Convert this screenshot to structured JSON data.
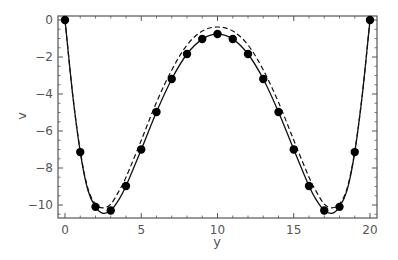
{
  "chart_data": {
    "type": "line",
    "title": "",
    "xlabel": "y",
    "ylabel": "v",
    "xlim": [
      -0.5,
      20.5
    ],
    "ylim": [
      -10.75,
      0.25
    ],
    "x_ticks": [
      0,
      5,
      10,
      15,
      20
    ],
    "y_ticks": [
      0,
      -2,
      -4,
      -6,
      -8,
      -10
    ],
    "grid": false,
    "legend": null,
    "series": [
      {
        "name": "data points",
        "style": "markers",
        "x": [
          0,
          1,
          2,
          3,
          4,
          5,
          6,
          7,
          8,
          9,
          10,
          11,
          12,
          13,
          14,
          15,
          16,
          17,
          18,
          19,
          20
        ],
        "values": [
          0,
          -7.14,
          -10.1,
          -10.3,
          -8.97,
          -7.0,
          -4.97,
          -3.19,
          -1.84,
          -1.03,
          -0.76,
          -1.03,
          -1.84,
          -3.19,
          -4.97,
          -7.0,
          -8.97,
          -10.3,
          -10.1,
          -7.14,
          0
        ]
      },
      {
        "name": "solid curve",
        "style": "solid",
        "x": [
          0,
          0.5,
          1,
          1.5,
          2,
          2.5,
          3,
          3.5,
          4,
          5,
          6,
          7,
          8,
          9,
          10,
          11,
          12,
          13,
          14,
          15,
          16,
          16.5,
          17,
          17.5,
          18,
          18.5,
          19,
          19.5,
          20
        ],
        "values": [
          0,
          -4.0,
          -7.14,
          -9.2,
          -10.1,
          -10.45,
          -10.3,
          -9.75,
          -8.97,
          -7.0,
          -4.97,
          -3.19,
          -1.84,
          -1.03,
          -0.76,
          -1.03,
          -1.84,
          -3.19,
          -4.97,
          -7.0,
          -8.97,
          -9.75,
          -10.3,
          -10.45,
          -10.1,
          -9.2,
          -7.14,
          -4.0,
          0
        ]
      },
      {
        "name": "dashed curve",
        "style": "dashed",
        "x": [
          0,
          0.5,
          1,
          1.5,
          2,
          2.5,
          3,
          3.5,
          4,
          5,
          6,
          7,
          8,
          9,
          10,
          11,
          12,
          13,
          14,
          15,
          16,
          16.5,
          17,
          17.5,
          18,
          18.5,
          19,
          19.5,
          20
        ],
        "values": [
          0,
          -4.0,
          -7.1,
          -9.1,
          -9.95,
          -10.15,
          -9.95,
          -9.3,
          -8.5,
          -6.5,
          -4.45,
          -2.7,
          -1.35,
          -0.6,
          -0.38,
          -0.6,
          -1.35,
          -2.7,
          -4.45,
          -6.5,
          -8.5,
          -9.3,
          -9.95,
          -10.15,
          -9.95,
          -9.1,
          -7.1,
          -4.0,
          0
        ]
      }
    ]
  },
  "axes": {
    "x_label": "y",
    "y_label": "v",
    "x_tick_labels": [
      "0",
      "5",
      "10",
      "15",
      "20"
    ],
    "y_tick_labels": [
      "0",
      "-2",
      "-4",
      "-6",
      "-8",
      "-10"
    ]
  }
}
